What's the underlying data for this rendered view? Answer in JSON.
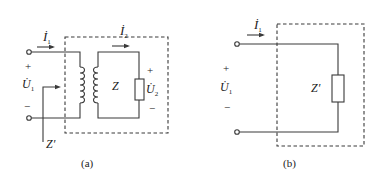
{
  "diagram_a": {
    "caption": "(a)",
    "current_primary": "İ",
    "current_primary_sub": "1",
    "current_secondary": "İ",
    "current_secondary_sub": "2",
    "voltage_primary": "U̇",
    "voltage_primary_sub": "1",
    "voltage_secondary": "U̇",
    "voltage_secondary_sub": "2",
    "plus": "+",
    "minus": "−",
    "load": "Z",
    "equivalent": "Z′"
  },
  "diagram_b": {
    "caption": "(b)",
    "current_primary": "İ",
    "current_primary_sub": "1",
    "voltage_primary": "U̇",
    "voltage_primary_sub": "1",
    "plus": "+",
    "minus": "−",
    "equivalent": "Z′"
  },
  "colors": {
    "line": "#3a3a3a",
    "text": "#222222"
  }
}
